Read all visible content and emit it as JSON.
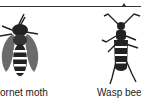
{
  "figure": {
    "bracket": "top-grouping-bracket",
    "specimens": [
      {
        "name": "Hornet moth",
        "visible_label": "ornet moth",
        "icon": "hornet-moth-illustration"
      },
      {
        "name": "Wasp beetle",
        "visible_label": "Wasp bee",
        "icon": "wasp-beetle-illustration"
      }
    ]
  },
  "colors": {
    "ink": "#222222",
    "background": "#ffffff",
    "wing_gray": "#6b6b6b"
  }
}
